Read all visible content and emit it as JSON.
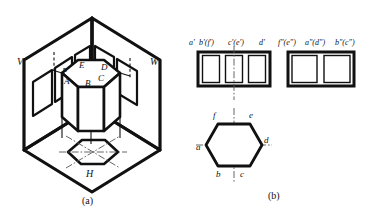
{
  "figure": {
    "captions": {
      "a": "(a)",
      "b": "(b)"
    }
  },
  "pictorial": {
    "plane_labels": {
      "v": "V",
      "w": "W",
      "h": "H"
    },
    "prism_vertex_labels": {
      "A": "A",
      "B": "B",
      "C": "C",
      "D": "D",
      "E": "E",
      "F": "F"
    }
  },
  "views": {
    "front": {
      "name": "front-view",
      "panel_count": 3,
      "labels": [
        "a'",
        "b'(f')",
        "c'(e')",
        "d'"
      ]
    },
    "side": {
      "name": "side-view",
      "panel_count": 2,
      "labels": [
        "f\"(e\")",
        "a\"(d\")",
        "b\"(c\")"
      ]
    },
    "top": {
      "name": "top-view",
      "shape": "hexagon",
      "labels": {
        "a": "a",
        "b": "b",
        "c": "c",
        "d": "d",
        "e": "e",
        "f": "f"
      }
    }
  },
  "colors": {
    "ink": "#111111",
    "paper": "#ffffff",
    "centerline": "#555555"
  }
}
